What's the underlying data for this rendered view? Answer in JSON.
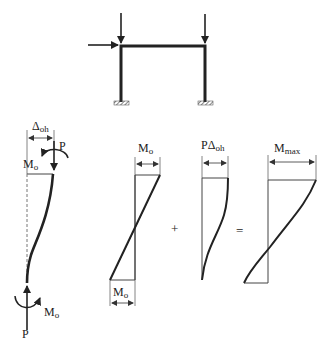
{
  "frame": {
    "description": "Portal frame with two vertical gravity loads and one lateral load, fixed supports"
  },
  "column": {
    "delta_label": "Δ",
    "delta_sub": "oh",
    "top_force_label": "P",
    "top_moment_label": "M",
    "top_moment_sub": "o",
    "bottom_force_label": "P",
    "bottom_moment_label": "M",
    "bottom_moment_sub": "o"
  },
  "diagrams": {
    "first": {
      "top_label": "M",
      "top_sub": "o",
      "bottom_label": "M",
      "bottom_sub": "o"
    },
    "plus_sign": "+",
    "second": {
      "top_label": "PΔ",
      "top_sub": "oh"
    },
    "equals_sign": "=",
    "third": {
      "top_label": "M",
      "top_sub": "max"
    }
  },
  "colors": {
    "line": "#222222",
    "dim": "#555555",
    "dashed": "#777777"
  }
}
